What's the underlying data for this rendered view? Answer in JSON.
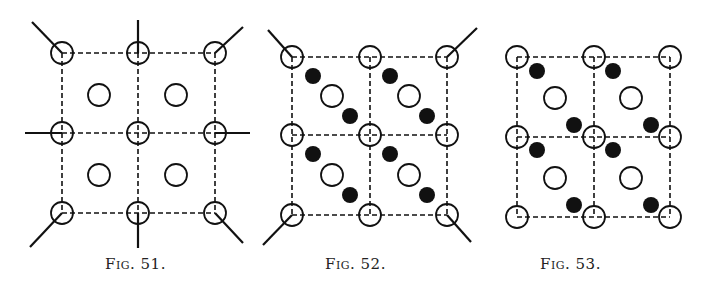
{
  "figures": [
    {
      "id": "fig51",
      "caption": "Fig. 51.",
      "caption_x": 105,
      "nodes_x": [
        62,
        138,
        215
      ],
      "nodes_y": [
        53,
        133,
        213
      ],
      "interior_open": [
        [
          99,
          95
        ],
        [
          176,
          95
        ],
        [
          99,
          175
        ],
        [
          176,
          175
        ]
      ],
      "interior_filled": [],
      "bonds": [
        [
          62,
          53,
          32,
          22
        ],
        [
          138,
          53,
          138,
          20
        ],
        [
          215,
          53,
          243,
          27
        ],
        [
          62,
          133,
          25,
          133
        ],
        [
          215,
          133,
          250,
          133
        ],
        [
          62,
          213,
          30,
          247
        ],
        [
          138,
          213,
          138,
          248
        ],
        [
          215,
          213,
          243,
          243
        ]
      ]
    },
    {
      "id": "fig52",
      "caption": "Fig. 52.",
      "caption_x": 325,
      "nodes_x": [
        292,
        370,
        447
      ],
      "nodes_y": [
        57,
        135,
        215
      ],
      "interior_open": [
        [
          332,
          96
        ],
        [
          409,
          96
        ],
        [
          332,
          175
        ],
        [
          409,
          175
        ]
      ],
      "interior_filled": [
        [
          313,
          76
        ],
        [
          350,
          116
        ],
        [
          390,
          76
        ],
        [
          427,
          116
        ],
        [
          313,
          154
        ],
        [
          350,
          195
        ],
        [
          390,
          154
        ],
        [
          427,
          195
        ]
      ],
      "bonds": [
        [
          292,
          57,
          268,
          30
        ],
        [
          447,
          57,
          477,
          28
        ],
        [
          292,
          215,
          263,
          245
        ],
        [
          447,
          215,
          471,
          242
        ]
      ]
    },
    {
      "id": "fig53",
      "caption": "Fig. 53.",
      "caption_x": 540,
      "nodes_x": [
        517,
        594,
        670
      ],
      "nodes_y": [
        57,
        137,
        217
      ],
      "interior_open": [
        [
          555,
          98
        ],
        [
          631,
          98
        ],
        [
          555,
          178
        ],
        [
          631,
          178
        ]
      ],
      "interior_filled": [
        [
          537,
          71
        ],
        [
          613,
          71
        ],
        [
          574,
          125
        ],
        [
          651,
          125
        ],
        [
          537,
          150
        ],
        [
          613,
          150
        ],
        [
          574,
          205
        ],
        [
          651,
          205
        ]
      ],
      "bonds": []
    }
  ]
}
